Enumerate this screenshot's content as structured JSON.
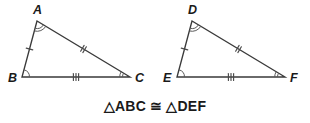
{
  "figure": {
    "width": 310,
    "height": 123,
    "background_color": "#ffffff",
    "line_color": "#3a3a3a",
    "mark_color": "#4a4a4a",
    "arc_color": "#5a5a5a",
    "label_color": "#1a1a1a"
  },
  "caption": {
    "text": "△ABC ≅ △DEF",
    "congruence_symbol": "≅",
    "triangle_symbol": "△"
  },
  "triangles": [
    {
      "id": "abc",
      "name": "triangle-abc",
      "vertices": [
        {
          "label": "A",
          "x": 37,
          "y": 21,
          "label_x": 33,
          "label_y": 14,
          "angle_arcs": 2
        },
        {
          "label": "B",
          "x": 22,
          "y": 77,
          "label_x": 8,
          "label_y": 82,
          "angle_arcs": 1
        },
        {
          "label": "C",
          "x": 130,
          "y": 77,
          "label_x": 135,
          "label_y": 82,
          "angle_arcs": 2
        }
      ],
      "sides": [
        {
          "name": "AB",
          "from": "A",
          "to": "B",
          "ticks": 1
        },
        {
          "name": "AC",
          "from": "A",
          "to": "C",
          "ticks": 2
        },
        {
          "name": "BC",
          "from": "B",
          "to": "C",
          "ticks": 3
        }
      ]
    },
    {
      "id": "def",
      "name": "triangle-def",
      "vertices": [
        {
          "label": "D",
          "x": 192,
          "y": 21,
          "label_x": 188,
          "label_y": 14,
          "angle_arcs": 2
        },
        {
          "label": "E",
          "x": 177,
          "y": 77,
          "label_x": 163,
          "label_y": 82,
          "angle_arcs": 1
        },
        {
          "label": "F",
          "x": 285,
          "y": 77,
          "label_x": 290,
          "label_y": 82,
          "angle_arcs": 2
        }
      ],
      "sides": [
        {
          "name": "DE",
          "from": "D",
          "to": "E",
          "ticks": 1
        },
        {
          "name": "DF",
          "from": "D",
          "to": "F",
          "ticks": 2
        },
        {
          "name": "EF",
          "from": "E",
          "to": "F",
          "ticks": 3
        }
      ]
    }
  ]
}
